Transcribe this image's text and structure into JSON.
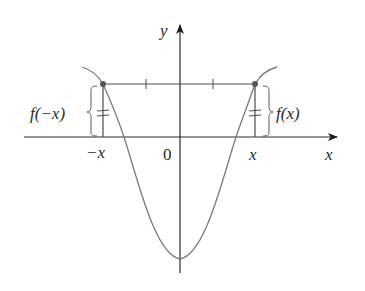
{
  "figure": {
    "axes": {
      "x_label": "x",
      "y_label": "y",
      "origin_label": "0",
      "neg_x_tick_label": "−x",
      "pos_x_tick_label": "x"
    },
    "annotations": {
      "left_value_label": "f(−x)",
      "right_value_label": "f(x)",
      "equal_marks": "=",
      "note": "Horizontal segment between (−x, f(−x)) and (x, f(x)) with congruence tick marks; double tick marks on vertical segments indicate equal heights"
    },
    "colors": {
      "axis": "#2a2a2a",
      "curve": "#7a7a7a",
      "segment": "#4a4a4a",
      "point": "#555555",
      "background": "#ffffff"
    }
  }
}
